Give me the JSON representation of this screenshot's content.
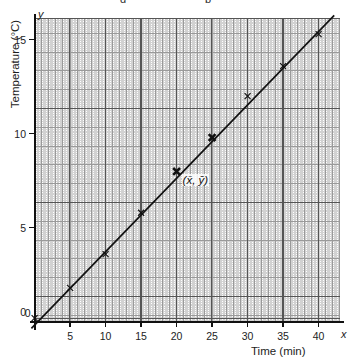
{
  "top_cut_text": {
    "fragment_left": "g",
    "fragment_right": "p"
  },
  "axes": {
    "x_variable": "x",
    "y_variable": "y",
    "x_title": "Time (min)",
    "y_title": "Temperature (°C)",
    "x_ticks": [
      0,
      5,
      10,
      15,
      20,
      25,
      30,
      35,
      40
    ],
    "y_ticks": [
      0,
      5,
      10,
      15
    ]
  },
  "annotations": [
    {
      "text": "(x̄, ȳ)",
      "x": 20.7,
      "y": 7.5
    }
  ],
  "chart_data": {
    "type": "scatter",
    "title": "",
    "xlabel": "Time (min)",
    "ylabel": "Temperature (°C)",
    "xlim": [
      0,
      43
    ],
    "ylim": [
      0,
      16.3
    ],
    "grid": true,
    "grid_style": "graph-paper, major gridlines every 5 units, minor every 1 unit, fine subdivisions",
    "legend": "none",
    "x_ticks": [
      0,
      5,
      10,
      15,
      20,
      25,
      30,
      35,
      40
    ],
    "y_ticks": [
      0,
      5,
      10,
      15
    ],
    "points": [
      {
        "x": 0,
        "y": 0.2,
        "marker": "x",
        "emphasis": false
      },
      {
        "x": 5,
        "y": 1.8,
        "marker": "x",
        "emphasis": false
      },
      {
        "x": 10,
        "y": 3.6,
        "marker": "x",
        "emphasis": false
      },
      {
        "x": 15,
        "y": 5.8,
        "marker": "x",
        "emphasis": false
      },
      {
        "x": 20,
        "y": 8.0,
        "marker": "x-bold",
        "emphasis": true
      },
      {
        "x": 25,
        "y": 9.8,
        "marker": "x-bold",
        "emphasis": true
      },
      {
        "x": 30,
        "y": 12.0,
        "marker": "x",
        "emphasis": false
      },
      {
        "x": 35,
        "y": 13.6,
        "marker": "x",
        "emphasis": false
      },
      {
        "x": 40,
        "y": 15.3,
        "marker": "x",
        "emphasis": false
      }
    ],
    "series": [
      {
        "name": "line of best fit",
        "type": "line",
        "x": [
          -0.45,
          42.2
        ],
        "y": [
          -0.35,
          16.3
        ]
      }
    ],
    "mean_point": {
      "x": 20,
      "y": 8.0,
      "label": "(x̄, ȳ)"
    }
  }
}
